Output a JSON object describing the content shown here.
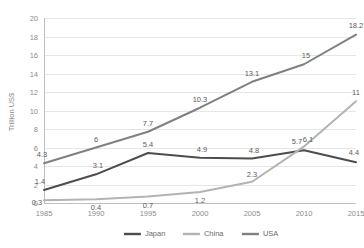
{
  "chart_data": {
    "type": "line",
    "title": "",
    "xlabel": "",
    "ylabel": "Trillion US$",
    "categories": [
      "1985",
      "1990",
      "1995",
      "2000",
      "2005",
      "2010",
      "2015"
    ],
    "ylim": [
      0,
      20
    ],
    "ytick_step": 2,
    "yticks": [
      "0",
      "2",
      "4",
      "6",
      "8",
      "10",
      "12",
      "14",
      "16",
      "18",
      "20"
    ],
    "grid": "horizontal",
    "legend_position": "bottom",
    "series": [
      {
        "name": "Japan",
        "color": "#4d4d4d",
        "values": [
          1.4,
          3.1,
          5.4,
          4.9,
          4.8,
          5.7,
          4.4
        ],
        "labels": [
          "1.4",
          "3.1",
          "5.4",
          "4.9",
          "4.8",
          "5.7",
          "4.4"
        ]
      },
      {
        "name": "China",
        "color": "#b3b3b3",
        "values": [
          0.3,
          0.4,
          0.7,
          1.2,
          2.3,
          6.1,
          11
        ],
        "labels": [
          "0.3",
          "0.4",
          "0.7",
          "1.2",
          "2.3",
          "6.1",
          "11"
        ]
      },
      {
        "name": "USA",
        "color": "#808080",
        "values": [
          4.3,
          6,
          7.7,
          10.3,
          13.1,
          15,
          18.2
        ],
        "labels": [
          "4.3",
          "6",
          "7.7",
          "10.3",
          "13.1",
          "15",
          "18.2"
        ]
      }
    ]
  },
  "legend": {
    "items": [
      {
        "label": "Japan",
        "color": "#4d4d4d"
      },
      {
        "label": "China",
        "color": "#b3b3b3"
      },
      {
        "label": "USA",
        "color": "#808080"
      }
    ]
  },
  "colors": {
    "background": "#ffffff",
    "grid": "#e6e6e6",
    "axis": "#bfbfbf",
    "tick_text": "#8c8c8c",
    "label_text": "#5c5c5c"
  }
}
